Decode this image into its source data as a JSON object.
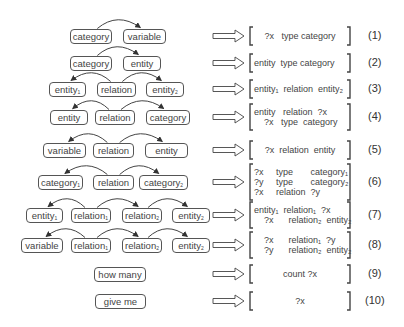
{
  "diagram": {
    "rows": [
      {
        "id": "1",
        "label": "(1)",
        "y": 36,
        "nodes": [
          {
            "text": "category",
            "sub": "",
            "x": 70,
            "w": 42
          },
          {
            "text": "variable",
            "sub": "",
            "x": 123,
            "w": 43
          }
        ],
        "arcs": [
          [
            0,
            1
          ]
        ],
        "query": [
          "?x   type category"
        ],
        "query_align": "center"
      },
      {
        "id": "2",
        "label": "(2)",
        "y": 63,
        "nodes": [
          {
            "text": "category",
            "sub": "",
            "x": 70,
            "w": 42
          },
          {
            "text": "entity",
            "sub": "",
            "x": 123,
            "w": 38
          }
        ],
        "arcs": [
          [
            0,
            1
          ]
        ],
        "query": [
          "entity  type category"
        ],
        "query_align": "left"
      },
      {
        "id": "3",
        "label": "(3)",
        "y": 89,
        "nodes": [
          {
            "text": "entity",
            "sub": "1",
            "x": 49,
            "w": 37
          },
          {
            "text": "relation",
            "sub": "",
            "x": 97,
            "w": 39
          },
          {
            "text": "entity",
            "sub": "2",
            "x": 146,
            "w": 38
          }
        ],
        "arcs": [
          [
            1,
            0
          ],
          [
            1,
            2
          ]
        ],
        "query": [
          "entity₁  relation  entity₂"
        ],
        "query_align": "left"
      },
      {
        "id": "4",
        "label": "(4)",
        "y": 117,
        "nodes": [
          {
            "text": "entity",
            "sub": "",
            "x": 50,
            "w": 38
          },
          {
            "text": "relation",
            "sub": "",
            "x": 95,
            "w": 40
          },
          {
            "text": "category",
            "sub": "",
            "x": 146,
            "w": 44
          }
        ],
        "arcs": [
          [
            1,
            0
          ],
          [
            1,
            2
          ]
        ],
        "query": [
          "entity   relation  ?x",
          "    ?x   type  category"
        ],
        "query_align": "left"
      },
      {
        "id": "5",
        "label": "(5)",
        "y": 150,
        "nodes": [
          {
            "text": "variable",
            "sub": "",
            "x": 43,
            "w": 43
          },
          {
            "text": "relation",
            "sub": "",
            "x": 93,
            "w": 41
          },
          {
            "text": "entity",
            "sub": "",
            "x": 145,
            "w": 43
          }
        ],
        "arcs": [
          [
            1,
            0
          ],
          [
            1,
            2
          ]
        ],
        "query": [
          "?x  relation  entity"
        ],
        "query_align": "center"
      },
      {
        "id": "6",
        "label": "(6)",
        "y": 182,
        "nodes": [
          {
            "text": "category",
            "sub": "1",
            "x": 38,
            "w": 45
          },
          {
            "text": "relation",
            "sub": "",
            "x": 93,
            "w": 41
          },
          {
            "text": "category",
            "sub": "2",
            "x": 139,
            "w": 49
          }
        ],
        "arcs": [
          [
            1,
            0
          ],
          [
            1,
            2
          ]
        ],
        "query": [
          "?x     type       category₁",
          "?y     type       category₂",
          "?x     relation  ?y"
        ],
        "query_align": "left"
      },
      {
        "id": "7",
        "label": "(7)",
        "y": 215,
        "nodes": [
          {
            "text": "entity",
            "sub": "1",
            "x": 26,
            "w": 37
          },
          {
            "text": "relation",
            "sub": "1",
            "x": 71,
            "w": 40
          },
          {
            "text": "relation",
            "sub": "2",
            "x": 122,
            "w": 40
          },
          {
            "text": "entity",
            "sub": "2",
            "x": 172,
            "w": 38
          }
        ],
        "arcs": [
          [
            1,
            0
          ],
          [
            1,
            2
          ],
          [
            2,
            3
          ]
        ],
        "query": [
          "entity₁  relation₁  ?x",
          "    ?x      relation₂  entity₂"
        ],
        "query_align": "left"
      },
      {
        "id": "8",
        "label": "(8)",
        "y": 245,
        "nodes": [
          {
            "text": "variable",
            "sub": "",
            "x": 21,
            "w": 42
          },
          {
            "text": "relation",
            "sub": "1",
            "x": 71,
            "w": 40
          },
          {
            "text": "relation",
            "sub": "2",
            "x": 122,
            "w": 40
          },
          {
            "text": "entity",
            "sub": "2",
            "x": 172,
            "w": 38
          }
        ],
        "arcs": [
          [
            1,
            0
          ],
          [
            1,
            2
          ],
          [
            2,
            3
          ]
        ],
        "query": [
          "    ?x      relation₁  ?y",
          "    ?y      relation₂  entity₂"
        ],
        "query_align": "left"
      },
      {
        "id": "9",
        "label": "(9)",
        "y": 274,
        "nodes": [
          {
            "text": "how many",
            "sub": "",
            "x": 94,
            "w": 52
          }
        ],
        "arcs": [],
        "query": [
          "count ?x"
        ],
        "query_align": "center"
      },
      {
        "id": "10",
        "label": "(10)",
        "y": 301,
        "nodes": [
          {
            "text": "give me",
            "sub": "",
            "x": 95,
            "w": 51
          }
        ],
        "arcs": [],
        "query": [
          "?x"
        ],
        "query_align": "center"
      }
    ],
    "colors": {
      "stroke": "#444444",
      "text": "#444444",
      "background": "#ffffff"
    }
  }
}
